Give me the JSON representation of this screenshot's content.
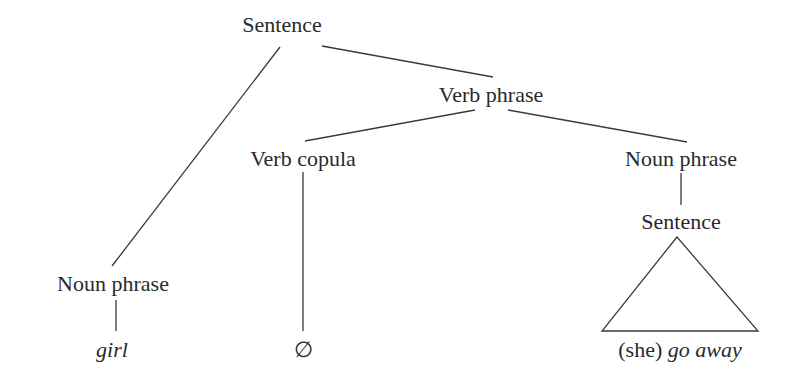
{
  "diagram": {
    "type": "syntax-tree",
    "nodes": {
      "root": {
        "label": "Sentence"
      },
      "vp": {
        "label": "Verb phrase"
      },
      "copula": {
        "label": "Verb copula"
      },
      "np_obj": {
        "label": "Noun phrase"
      },
      "embedded_s": {
        "label": "Sentence"
      },
      "np_subj": {
        "label": "Noun phrase"
      },
      "leaf_girl": {
        "label": "girl"
      },
      "leaf_null": {
        "label": "∅"
      },
      "leaf_she_pre": {
        "label": "(she) "
      },
      "leaf_go_away": {
        "label": "go away"
      }
    },
    "edges": [
      {
        "from": "Sentence",
        "to": "Noun phrase (subject)"
      },
      {
        "from": "Sentence",
        "to": "Verb phrase"
      },
      {
        "from": "Verb phrase",
        "to": "Verb copula"
      },
      {
        "from": "Verb phrase",
        "to": "Noun phrase (object)"
      },
      {
        "from": "Noun phrase (object)",
        "to": "Sentence (embedded)"
      },
      {
        "from": "Sentence (embedded)",
        "to": "(she) go away",
        "style": "triangle"
      },
      {
        "from": "Noun phrase (subject)",
        "to": "girl"
      },
      {
        "from": "Verb copula",
        "to": "∅"
      }
    ]
  }
}
